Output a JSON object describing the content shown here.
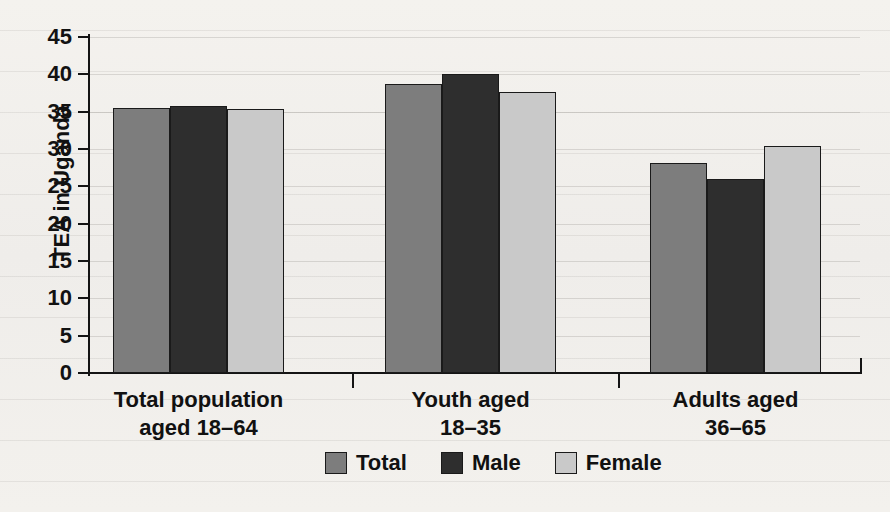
{
  "chart_data": {
    "type": "bar",
    "title": "",
    "xlabel": "",
    "ylabel": "TEA in Uganda",
    "ylim": [
      0,
      45
    ],
    "ytick_step": 5,
    "yticks": [
      45,
      40,
      35,
      30,
      25,
      20,
      15,
      10,
      5,
      0
    ],
    "grid": true,
    "legend_position": "bottom",
    "categories": [
      "Total population aged 18–64",
      "Youth aged 18–35",
      "Adults aged 36–65"
    ],
    "series": [
      {
        "name": "Total",
        "values": [
          35.5,
          38.7,
          28.1
        ],
        "color": "#7d7d7d"
      },
      {
        "name": "Male",
        "values": [
          35.7,
          40.0,
          26.0
        ],
        "color": "#2e2e2e"
      },
      {
        "name": "Female",
        "values": [
          35.3,
          37.6,
          30.4
        ],
        "color": "#c9c9c9"
      }
    ]
  },
  "axis": {
    "y_title": "TEA in Uganda",
    "ticks": [
      {
        "value": 45,
        "label": "45"
      },
      {
        "value": 40,
        "label": "40"
      },
      {
        "value": 35,
        "label": "35"
      },
      {
        "value": 30,
        "label": "30"
      },
      {
        "value": 25,
        "label": "25"
      },
      {
        "value": 20,
        "label": "20"
      },
      {
        "value": 15,
        "label": "15"
      },
      {
        "value": 10,
        "label": "10"
      },
      {
        "value": 5,
        "label": "5"
      },
      {
        "value": 0,
        "label": "0"
      }
    ]
  },
  "categories": [
    {
      "line1": "Total population",
      "line2": "aged 18–64"
    },
    {
      "line1": "Youth aged",
      "line2": "18–35"
    },
    {
      "line1": "Adults aged",
      "line2": "36–65"
    }
  ],
  "legend": {
    "items": [
      {
        "label": "Total",
        "color": "#7d7d7d"
      },
      {
        "label": "Male",
        "color": "#2e2e2e"
      },
      {
        "label": "Female",
        "color": "#c9c9c9"
      }
    ]
  }
}
